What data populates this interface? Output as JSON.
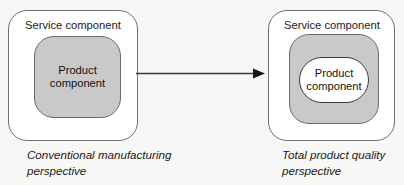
{
  "diagram": {
    "background_color": "#f7f7f5",
    "gray_fill": "#c9c9c9",
    "outline_color": "#6f6f6f",
    "left_group": {
      "service_label": "Service component",
      "product_label": "Product\ncomponent",
      "caption": "Conventional manufacturing\nperspective"
    },
    "right_group": {
      "service_label": "Service component",
      "product_label": "Product\ncomponent",
      "caption": "Total product quality\nperspective"
    },
    "arrow": {
      "name": "transition-arrow",
      "direction": "left-to-right"
    }
  }
}
